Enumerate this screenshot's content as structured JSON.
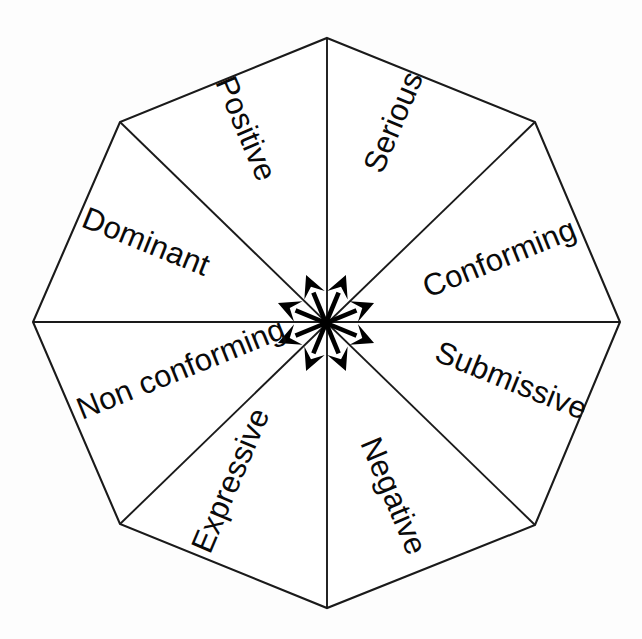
{
  "figure": {
    "shape": "octagon",
    "sector_count": 8,
    "background_color": "#fdfdfd",
    "line_color": "#1a1a1a",
    "text_color": "#0a0a0a",
    "arrow_color": "#000000"
  },
  "chart_data": {
    "type": "pie",
    "title": "",
    "subtitle": "",
    "xlabel": "",
    "ylabel": "",
    "legend_position": "none",
    "grid": false,
    "categories": [
      "Serious",
      "Conforming",
      "Submissive",
      "Negative",
      "Expressive",
      "Non conforming",
      "Dominant",
      "Positive"
    ],
    "values": [
      12.5,
      12.5,
      12.5,
      12.5,
      12.5,
      12.5,
      12.5,
      12.5
    ],
    "annotations": [
      "Serious",
      "Conforming",
      "Submissive",
      "Negative",
      "Expressive",
      "Non conforming",
      "Dominant",
      "Positive"
    ]
  },
  "sectors": [
    {
      "id": "serious",
      "label": "Serious",
      "center_angle_deg": 292.5,
      "text_rotation_deg": -67,
      "x": 382,
      "y": 175,
      "arrow_direction": "up-right-steep"
    },
    {
      "id": "conforming",
      "label": "Conforming",
      "center_angle_deg": 337.5,
      "text_rotation_deg": -22,
      "x": 428,
      "y": 298,
      "arrow_direction": "right-up-shallow"
    },
    {
      "id": "submissive",
      "label": "Submissive",
      "center_angle_deg": 22.5,
      "text_rotation_deg": 22,
      "x": 433,
      "y": 360,
      "arrow_direction": "right-down-shallow"
    },
    {
      "id": "negative",
      "label": "Negative",
      "center_angle_deg": 67.5,
      "text_rotation_deg": 67,
      "x": 360,
      "y": 443,
      "arrow_direction": "down-right-steep"
    },
    {
      "id": "expressive",
      "label": "Expressive",
      "center_angle_deg": 112.5,
      "text_rotation_deg": -67,
      "x": 210,
      "y": 555,
      "arrow_direction": "down-left-steep"
    },
    {
      "id": "non-conforming",
      "label": "Non conforming",
      "center_angle_deg": 157.5,
      "text_rotation_deg": -22,
      "x": 82,
      "y": 420,
      "arrow_direction": "left-down-shallow"
    },
    {
      "id": "dominant",
      "label": "Dominant",
      "center_angle_deg": 202.5,
      "text_rotation_deg": 22,
      "x": 80,
      "y": 226,
      "arrow_direction": "left-up-shallow"
    },
    {
      "id": "positive",
      "label": "Positive",
      "center_angle_deg": 247.5,
      "text_rotation_deg": 67,
      "x": 215,
      "y": 82,
      "arrow_direction": "up-left-steep"
    }
  ],
  "geometry": {
    "center": {
      "x": 326,
      "y": 323
    },
    "vertices": [
      {
        "name": "top",
        "x": 327,
        "y": 38
      },
      {
        "name": "upper-right",
        "x": 535,
        "y": 122
      },
      {
        "name": "right",
        "x": 620,
        "y": 322
      },
      {
        "name": "lower-right",
        "x": 535,
        "y": 525
      },
      {
        "name": "bottom",
        "x": 327,
        "y": 608
      },
      {
        "name": "lower-left",
        "x": 120,
        "y": 524
      },
      {
        "name": "left",
        "x": 33,
        "y": 322
      },
      {
        "name": "upper-left",
        "x": 120,
        "y": 122
      }
    ],
    "arrow_length": 52,
    "arrow_head_length": 22,
    "arrow_head_half_width": 11
  }
}
